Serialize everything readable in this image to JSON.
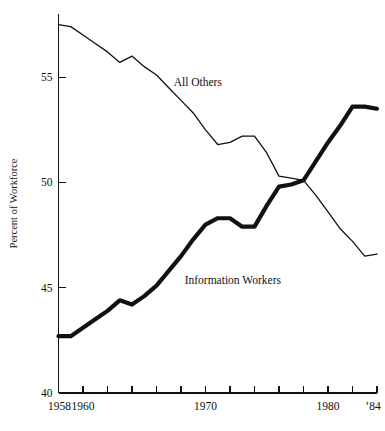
{
  "chart_data": {
    "type": "line",
    "title": "",
    "xlabel": "",
    "ylabel": "Percent of Workforce",
    "ylim": [
      40,
      58
    ],
    "xlim": [
      1958,
      1984
    ],
    "grid": false,
    "legend_position": "inline-annotation",
    "y_ticks": [
      40,
      45,
      50,
      55
    ],
    "y_tick_labels": [
      "40",
      "45",
      "50",
      "55"
    ],
    "x_ticks": [
      1958,
      1960,
      1962,
      1964,
      1966,
      1968,
      1970,
      1972,
      1974,
      1976,
      1978,
      1980,
      1982,
      1984
    ],
    "x_tick_labels": [
      "1958",
      "1960",
      "",
      "",
      "",
      "",
      "1970",
      "",
      "",
      "",
      "",
      "1980",
      "",
      "'84"
    ],
    "x_labeled_ticks": [
      {
        "year": 1958,
        "label": "1958"
      },
      {
        "year": 1960,
        "label": "1960"
      },
      {
        "year": 1970,
        "label": "1970"
      },
      {
        "year": 1980,
        "label": "1980"
      },
      {
        "year": 1984,
        "label": "’84"
      }
    ],
    "series": [
      {
        "name": "All Others",
        "style": "thin",
        "label_x": 1967.4,
        "label_y": 54.6,
        "x": [
          1958,
          1959,
          1960,
          1961,
          1962,
          1963,
          1964,
          1965,
          1966,
          1967,
          1968,
          1969,
          1970,
          1971,
          1972,
          1973,
          1974,
          1975,
          1976,
          1977,
          1978,
          1979,
          1980,
          1981,
          1982,
          1983,
          1984
        ],
        "values": [
          57.5,
          57.4,
          57.0,
          56.6,
          56.2,
          55.7,
          56.0,
          55.5,
          55.1,
          54.5,
          53.9,
          53.3,
          52.5,
          51.8,
          51.9,
          52.2,
          52.2,
          51.4,
          50.3,
          50.2,
          50.1,
          49.4,
          48.6,
          47.8,
          47.2,
          46.5,
          46.6
        ]
      },
      {
        "name": "Information Workers",
        "style": "thick",
        "label_x": 1968.3,
        "label_y": 45.2,
        "x": [
          1958,
          1959,
          1960,
          1961,
          1962,
          1963,
          1964,
          1965,
          1966,
          1967,
          1968,
          1969,
          1970,
          1971,
          1972,
          1973,
          1974,
          1975,
          1976,
          1977,
          1978,
          1979,
          1980,
          1981,
          1982,
          1983,
          1984
        ],
        "values": [
          42.7,
          42.7,
          43.1,
          43.5,
          43.9,
          44.4,
          44.2,
          44.6,
          45.1,
          45.8,
          46.5,
          47.3,
          48.0,
          48.3,
          48.3,
          47.9,
          47.9,
          48.9,
          49.8,
          49.9,
          50.1,
          51.0,
          51.9,
          52.7,
          53.6,
          53.6,
          53.5
        ]
      }
    ]
  },
  "annotations": {
    "all_others_label": "All Others",
    "information_workers_label": "Information Workers"
  }
}
